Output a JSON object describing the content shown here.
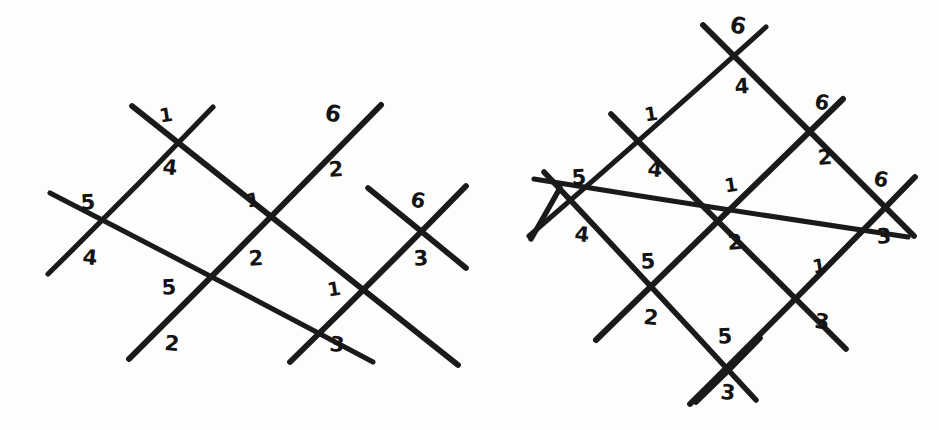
{
  "figure": {
    "kind": "hand-drawn-wiring-diagram",
    "background_color": "#fdfdfc",
    "ink_color": "#1a1a1a",
    "stroke_width": 5.5,
    "label_color": "#141414",
    "panel_count": 2,
    "panels": [
      {
        "id": "left-diagram",
        "name": "left-wiring-diagram",
        "description": "Two diamonds sharing a central crossing; six crossings total, each annotated with a digit above and a digit below.",
        "crossings": [
          {
            "id": "L-top-left",
            "name": "crossing-top-left",
            "x": 165,
            "y": 142,
            "above": "1",
            "below": "4"
          },
          {
            "id": "L-west",
            "name": "crossing-west",
            "x": 87,
            "y": 232,
            "above": "5",
            "below": "4"
          },
          {
            "id": "L-center",
            "name": "crossing-center",
            "x": 252,
            "y": 229,
            "above": "1",
            "below": "2"
          },
          {
            "id": "L-bottom-left",
            "name": "crossing-bottom-left",
            "x": 170,
            "y": 317,
            "above": "5",
            "below": "2"
          },
          {
            "id": "L-top-right",
            "name": "crossing-top-right",
            "x": 332,
            "y": 143,
            "above": "6",
            "below": "2"
          },
          {
            "id": "L-east",
            "name": "crossing-east",
            "x": 418,
            "y": 230,
            "above": "6",
            "below": "3"
          },
          {
            "id": "L-bottom-right",
            "name": "crossing-bottom-right",
            "x": 334,
            "y": 318,
            "above": "1",
            "below": "3"
          }
        ],
        "labels": [
          {
            "text": "1",
            "x": 166,
            "y": 115,
            "tilt": "tilt-a",
            "size": "sz-s",
            "name": "label-1-top-left-above"
          },
          {
            "text": "4",
            "x": 170,
            "y": 168,
            "tilt": "tilt-b",
            "size": "",
            "name": "label-4-top-left-below"
          },
          {
            "text": "5",
            "x": 88,
            "y": 203,
            "tilt": "tilt-c",
            "size": "",
            "name": "label-5-west-above"
          },
          {
            "text": "4",
            "x": 90,
            "y": 258,
            "tilt": "tilt-b",
            "size": "",
            "name": "label-4-west-below"
          },
          {
            "text": "1",
            "x": 253,
            "y": 200,
            "tilt": "tilt-a",
            "size": "sz-s",
            "name": "label-1-center-above"
          },
          {
            "text": "2",
            "x": 256,
            "y": 259,
            "tilt": "tilt-c",
            "size": "",
            "name": "label-2-center-below"
          },
          {
            "text": "5",
            "x": 169,
            "y": 288,
            "tilt": "tilt-c",
            "size": "",
            "name": "label-5-bottom-left-above"
          },
          {
            "text": "2",
            "x": 172,
            "y": 344,
            "tilt": "tilt-b",
            "size": "",
            "name": "label-2-bottom-left-below"
          },
          {
            "text": "6",
            "x": 333,
            "y": 114,
            "tilt": "tilt-d",
            "size": "sz-l",
            "name": "label-6-top-right-above"
          },
          {
            "text": "2",
            "x": 336,
            "y": 170,
            "tilt": "tilt-c",
            "size": "",
            "name": "label-2-top-right-below"
          },
          {
            "text": "6",
            "x": 418,
            "y": 201,
            "tilt": "tilt-d",
            "size": "",
            "name": "label-6-east-above"
          },
          {
            "text": "3",
            "x": 421,
            "y": 259,
            "tilt": "tilt-c",
            "size": "",
            "name": "label-3-east-below"
          },
          {
            "text": "1",
            "x": 334,
            "y": 289,
            "tilt": "tilt-a",
            "size": "sz-s",
            "name": "label-1-bottom-right-above"
          },
          {
            "text": "3",
            "x": 337,
            "y": 345,
            "tilt": "tilt-b",
            "size": "",
            "name": "label-3-bottom-right-below"
          }
        ],
        "strokes": [
          {
            "name": "wire-nw-long",
            "x1": 50,
            "y1": 193,
            "x2": 373,
            "y2": 362
          },
          {
            "name": "wire-sw-long",
            "x1": 48,
            "y1": 274,
            "x2": 213,
            "y2": 107
          },
          {
            "name": "wire-mid-rise",
            "x1": 129,
            "y1": 359,
            "x2": 381,
            "y2": 105
          },
          {
            "name": "wire-mid-fall",
            "x1": 132,
            "y1": 106,
            "x2": 458,
            "y2": 365
          },
          {
            "name": "wire-east-rise",
            "x1": 290,
            "y1": 362,
            "x2": 466,
            "y2": 186
          },
          {
            "name": "wire-east-fall",
            "x1": 368,
            "y1": 188,
            "x2": 466,
            "y2": 268
          }
        ]
      },
      {
        "id": "right-diagram",
        "name": "right-wiring-diagram",
        "description": "Two-by-two rotated grid of diamonds; nine crossings, each annotated with a digit above and a digit below.",
        "crossings": [
          {
            "id": "R-north",
            "name": "crossing-north",
            "x": 737,
            "y": 57,
            "above": "6",
            "below": "4"
          },
          {
            "id": "R-nw",
            "name": "crossing-northwest",
            "x": 649,
            "y": 142,
            "above": "1",
            "below": "4"
          },
          {
            "id": "R-ne",
            "name": "crossing-northeast",
            "x": 820,
            "y": 130,
            "above": "6",
            "below": "2"
          },
          {
            "id": "R-west",
            "name": "crossing-west",
            "x": 580,
            "y": 207,
            "above": "5",
            "below": "4"
          },
          {
            "id": "R-center",
            "name": "crossing-center",
            "x": 730,
            "y": 215,
            "above": "1",
            "below": "2"
          },
          {
            "id": "R-east",
            "name": "crossing-east",
            "x": 880,
            "y": 208,
            "above": "6",
            "below": "3"
          },
          {
            "id": "R-sw",
            "name": "crossing-southwest",
            "x": 648,
            "y": 290,
            "above": "5",
            "below": "2"
          },
          {
            "id": "R-se",
            "name": "crossing-southeast",
            "x": 818,
            "y": 294,
            "above": "1",
            "below": "3"
          },
          {
            "id": "R-south",
            "name": "crossing-south",
            "x": 725,
            "y": 365,
            "above": "5",
            "below": "3"
          }
        ],
        "labels": [
          {
            "text": "6",
            "x": 738,
            "y": 26,
            "tilt": "tilt-d",
            "size": "sz-l",
            "name": "label-6-north-above"
          },
          {
            "text": "4",
            "x": 742,
            "y": 87,
            "tilt": "tilt-c",
            "size": "",
            "name": "label-4-north-below"
          },
          {
            "text": "1",
            "x": 651,
            "y": 114,
            "tilt": "tilt-a",
            "size": "sz-s",
            "name": "label-1-northwest-above"
          },
          {
            "text": "4",
            "x": 655,
            "y": 170,
            "tilt": "tilt-b",
            "size": "",
            "name": "label-4-northwest-below"
          },
          {
            "text": "6",
            "x": 822,
            "y": 103,
            "tilt": "tilt-d",
            "size": "",
            "name": "label-6-northeast-above"
          },
          {
            "text": "2",
            "x": 825,
            "y": 158,
            "tilt": "tilt-c",
            "size": "",
            "name": "label-2-northeast-below"
          },
          {
            "text": "5",
            "x": 579,
            "y": 178,
            "tilt": "tilt-c",
            "size": "",
            "name": "label-5-west-above"
          },
          {
            "text": "4",
            "x": 582,
            "y": 235,
            "tilt": "tilt-b",
            "size": "",
            "name": "label-4-west-below"
          },
          {
            "text": "1",
            "x": 731,
            "y": 185,
            "tilt": "tilt-a",
            "size": "sz-s",
            "name": "label-1-center-above"
          },
          {
            "text": "2",
            "x": 735,
            "y": 243,
            "tilt": "tilt-c",
            "size": "",
            "name": "label-2-center-below"
          },
          {
            "text": "6",
            "x": 881,
            "y": 180,
            "tilt": "tilt-d",
            "size": "",
            "name": "label-6-east-above"
          },
          {
            "text": "3",
            "x": 884,
            "y": 237,
            "tilt": "tilt-c",
            "size": "",
            "name": "label-3-east-below"
          },
          {
            "text": "5",
            "x": 648,
            "y": 262,
            "tilt": "tilt-c",
            "size": "",
            "name": "label-5-southwest-above"
          },
          {
            "text": "2",
            "x": 651,
            "y": 318,
            "tilt": "tilt-b",
            "size": "",
            "name": "label-2-southwest-below"
          },
          {
            "text": "1",
            "x": 819,
            "y": 266,
            "tilt": "tilt-a",
            "size": "sz-s",
            "name": "label-1-southeast-above"
          },
          {
            "text": "3",
            "x": 822,
            "y": 322,
            "tilt": "tilt-b",
            "size": "",
            "name": "label-3-southeast-below"
          },
          {
            "text": "5",
            "x": 725,
            "y": 337,
            "tilt": "tilt-c",
            "size": "",
            "name": "label-5-south-above"
          },
          {
            "text": "3",
            "x": 728,
            "y": 393,
            "tilt": "tilt-b",
            "size": "",
            "name": "label-3-south-below"
          }
        ],
        "strokes": [
          {
            "name": "wire-nw-outer",
            "x1": 529,
            "y1": 236,
            "x2": 766,
            "y2": 27
          },
          {
            "name": "wire-nw-inner",
            "x1": 534,
            "y1": 179,
            "x2": 908,
            "y2": 237
          },
          {
            "name": "wire-w-long",
            "x1": 596,
            "y1": 340,
            "x2": 843,
            "y2": 99
          },
          {
            "name": "wire-sw-outer",
            "x1": 690,
            "y1": 404,
            "x2": 915,
            "y2": 177
          },
          {
            "name": "wire-ne-fall",
            "x1": 703,
            "y1": 25,
            "x2": 914,
            "y2": 236
          },
          {
            "name": "wire-ne-inner",
            "x1": 611,
            "y1": 114,
            "x2": 846,
            "y2": 349
          },
          {
            "name": "wire-sw-fall",
            "x1": 544,
            "y1": 172,
            "x2": 756,
            "y2": 400
          },
          {
            "name": "wire-s-rise",
            "x1": 696,
            "y1": 402,
            "x2": 760,
            "y2": 338
          },
          {
            "name": "wire-w-short",
            "x1": 531,
            "y1": 239,
            "x2": 560,
            "y2": 188
          }
        ]
      }
    ]
  }
}
